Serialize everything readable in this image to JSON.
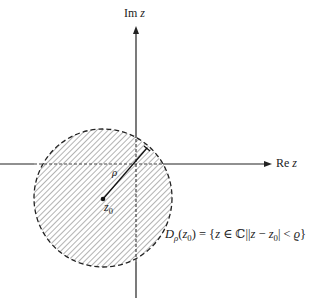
{
  "diagram": {
    "axes": {
      "real_label_prefix": "Re",
      "real_label_var": "z",
      "imag_label_prefix": "Im",
      "imag_label_var": "z",
      "origin": {
        "x": 136,
        "y": 164
      },
      "color": "#222222"
    },
    "disk": {
      "center": {
        "x": 103,
        "y": 198
      },
      "radius": 69,
      "border_style": "dashed",
      "fill_pattern": "diagonal-hatch",
      "hatch_color": "#888888"
    },
    "center_point": {
      "label_var": "z",
      "label_sub": "0"
    },
    "radius_segment": {
      "label": "ρ",
      "end": {
        "x": 147,
        "y": 148
      }
    },
    "definition": {
      "lhs_var": "D",
      "lhs_sub": "ρ",
      "lhs_arg_var": "z",
      "lhs_arg_sub": "0",
      "rhs_text_1": ") = {",
      "rhs_z": "z",
      "rhs_in": " ∈ ℂ||",
      "rhs_z2": "z",
      "rhs_minus": " − ",
      "rhs_z0": "z",
      "rhs_z0_sub": "0",
      "rhs_lt": "| < ",
      "rhs_rho": "ϱ",
      "rhs_close": "}"
    }
  }
}
